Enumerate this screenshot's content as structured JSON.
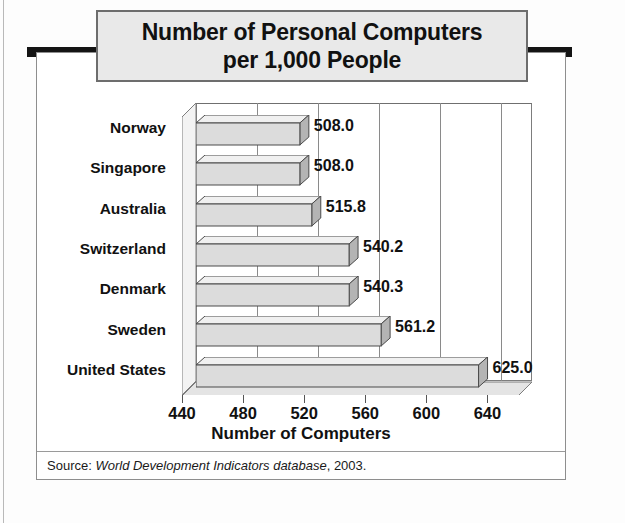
{
  "title": {
    "line1": "Number of Personal Computers",
    "line2": "per 1,000 People"
  },
  "source": {
    "prefix": "Source: ",
    "italic": "World Development Indicators database",
    "suffix": ", 2003."
  },
  "axis": {
    "x_title": "Number of Computers",
    "ticks": [
      "440",
      "480",
      "520",
      "560",
      "600",
      "640"
    ]
  },
  "chart_data": {
    "type": "bar",
    "orientation": "horizontal",
    "title": "Number of Personal Computers per 1,000 People",
    "xlabel": "Number of Computers",
    "ylabel": "",
    "xlim": [
      440,
      660
    ],
    "xticks": [
      440,
      480,
      520,
      560,
      600,
      640
    ],
    "grid": true,
    "legend": null,
    "categories": [
      "Norway",
      "Singapore",
      "Australia",
      "Switzerland",
      "Denmark",
      "Sweden",
      "United States"
    ],
    "values": [
      508.0,
      508.0,
      515.8,
      540.2,
      540.3,
      561.2,
      625.0
    ],
    "data_labels": [
      "508.0",
      "508.0",
      "515.8",
      "540.2",
      "540.3",
      "561.2",
      "625.0"
    ],
    "source_note": "Source: World Development Indicators database, 2003."
  },
  "colors": {
    "bar_face": "#dcdcdc",
    "bar_top": "#f0f0f0",
    "bar_side": "#b4b4b4",
    "bar_outline": "#4a4a4a",
    "title_box_fill": "#e9e9e9",
    "title_box_border": "#6d6d6d",
    "rule": "#141414",
    "frame_border": "#8e8e8e",
    "text": "#111111"
  }
}
